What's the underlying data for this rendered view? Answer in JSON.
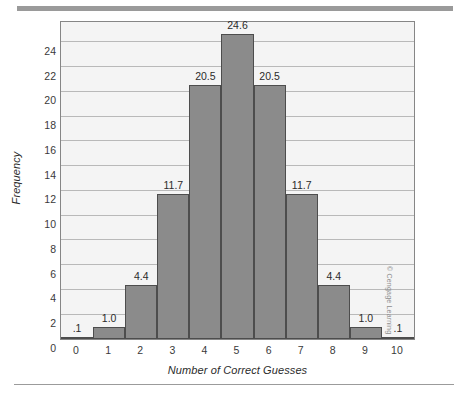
{
  "figure": {
    "credit": "© Cengage Learning",
    "top_rule_color": "#9a9a9a",
    "bottom_rule_color": "#9b9b9b"
  },
  "chart_data": {
    "type": "bar",
    "title": "",
    "subtitle": "",
    "xlabel": "Number of Correct Guesses",
    "ylabel": "Frequency",
    "categories": [
      "0",
      "1",
      "2",
      "3",
      "4",
      "5",
      "6",
      "7",
      "8",
      "9",
      "10"
    ],
    "values": [
      0.1,
      1.0,
      4.4,
      11.7,
      20.5,
      24.6,
      20.5,
      11.7,
      4.4,
      1.0,
      0.1
    ],
    "data_labels": [
      ".1",
      "1.0",
      "4.4",
      "11.7",
      "20.5",
      "24.6",
      "20.5",
      "11.7",
      "4.4",
      "1.0",
      ".1"
    ],
    "ylim": [
      0,
      25.6
    ],
    "xlim": [
      -0.5,
      10.5
    ],
    "yticks": [
      0,
      2,
      4,
      6,
      8,
      10,
      12,
      14,
      16,
      18,
      20,
      22,
      24
    ],
    "ytick_labels": [
      "0",
      "2",
      "4",
      "6",
      "8",
      "10",
      "12",
      "14",
      "16",
      "18",
      "20",
      "22",
      "24"
    ],
    "xtick_labels": [
      "0",
      "1",
      "2",
      "3",
      "4",
      "5",
      "6",
      "7",
      "8",
      "9",
      "10"
    ],
    "grid": true,
    "grid_axis": "y",
    "legend": false,
    "legend_position": "none",
    "bar_fill_color": "#8b8b8b",
    "bar_edge_color": "#4d4d4d",
    "plot_background": "#f4f4f4",
    "gridline_color": "#b9b9b9",
    "axis_border_color": "#868686"
  }
}
